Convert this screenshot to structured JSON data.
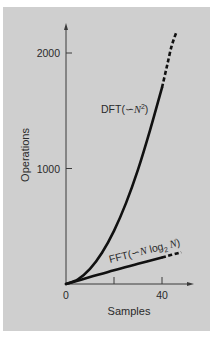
{
  "chart_data": {
    "type": "line",
    "title": "",
    "xlabel": "Samples",
    "ylabel": "Operations",
    "x_ticks": [
      {
        "value": 0,
        "label": "0"
      },
      {
        "value": 20,
        "label": ""
      },
      {
        "value": 40,
        "label": "40"
      }
    ],
    "y_ticks": [
      {
        "value": 1000,
        "label": "1000"
      },
      {
        "value": 2000,
        "label": "2000"
      }
    ],
    "origin_label": "0",
    "xlim": [
      0,
      53
    ],
    "ylim": [
      0,
      2250
    ],
    "grid": false,
    "legend": "inline labels",
    "series": [
      {
        "name": "DFT(∽N²)",
        "label_main": "DFT(∽",
        "label_var": "N",
        "label_sup": "2",
        "label_close": ")",
        "style": "solid then dashed",
        "x": [
          0,
          5,
          10,
          15,
          20,
          25,
          30,
          35,
          40,
          42,
          44,
          46
        ],
        "values": [
          0,
          40,
          130,
          270,
          460,
          700,
          990,
          1330,
          1700,
          1880,
          2060,
          2180
        ],
        "solid_until_x": 40
      },
      {
        "name": "FFT(∽N log₂ N)",
        "label_main": "FFT(∽",
        "label_var": "N",
        "label_log": " log",
        "label_sub": "2",
        "label_var2": " N",
        "label_close": ")",
        "style": "solid then dashed",
        "x": [
          0,
          10,
          20,
          30,
          40,
          48
        ],
        "values": [
          0,
          60,
          120,
          175,
          230,
          275
        ],
        "solid_until_x": 40
      }
    ]
  }
}
